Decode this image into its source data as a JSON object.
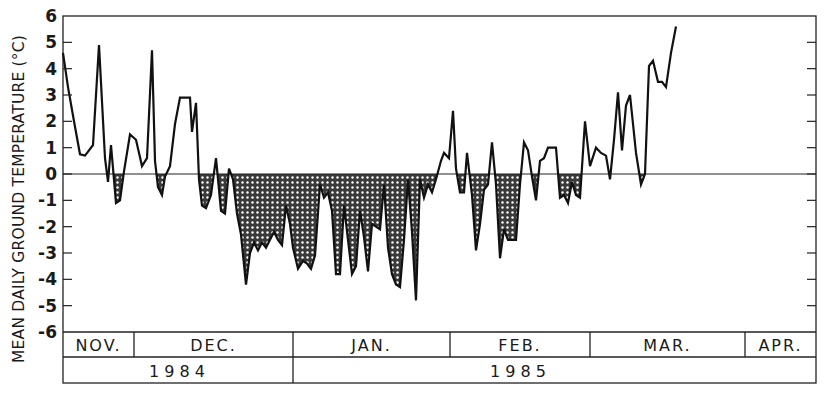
{
  "chart_data": {
    "type": "line",
    "title": "",
    "ylabel": "MEAN DAILY GROUND TEMPERATURE  (°C)",
    "xlabel": "",
    "ylim": [
      -6,
      6
    ],
    "yticks": [
      6,
      5,
      4,
      3,
      2,
      1,
      0,
      -1,
      -2,
      -3,
      -4,
      -5,
      -6
    ],
    "grid": false,
    "legend": null,
    "shading": "cross-hatched area between curve and 0 °C where temperature is below zero",
    "months": [
      {
        "label": "NOV.",
        "x0": 63,
        "x1": 134
      },
      {
        "label": "DEC.",
        "x0": 134,
        "x1": 293
      },
      {
        "label": "JAN.",
        "x0": 293,
        "x1": 450
      },
      {
        "label": "FEB.",
        "x0": 450,
        "x1": 590
      },
      {
        "label": "MAR.",
        "x0": 590,
        "x1": 745
      },
      {
        "label": "APR.",
        "x0": 745,
        "x1": 816
      }
    ],
    "years": [
      {
        "label": "1 9 8 4",
        "x0": 63,
        "x1": 293
      },
      {
        "label": "1 9 8 5",
        "x0": 293,
        "x1": 816
      }
    ],
    "series": [
      {
        "name": "Mean daily ground temperature",
        "points_px_x": [
          63,
          68,
          74,
          80,
          85,
          89,
          93,
          99,
          105,
          108,
          111,
          116,
          120,
          124,
          130,
          136,
          142,
          147,
          152,
          155,
          158,
          162,
          165,
          170,
          175,
          180,
          185,
          190,
          192,
          196,
          199,
          202,
          206,
          211,
          216,
          221,
          225,
          229,
          233,
          237,
          241,
          246,
          250,
          254,
          258,
          262,
          266,
          270,
          274,
          278,
          282,
          286,
          290,
          293,
          298,
          303,
          307,
          311,
          315,
          320,
          324,
          328,
          332,
          336,
          340,
          344,
          348,
          352,
          356,
          360,
          364,
          368,
          372,
          376,
          380,
          384,
          388,
          392,
          396,
          400,
          404,
          408,
          412,
          416,
          420,
          424,
          428,
          432,
          436,
          441,
          444,
          449,
          453,
          456,
          460,
          464,
          467,
          472,
          476,
          480,
          484,
          488,
          492,
          496,
          500,
          504,
          508,
          512,
          516,
          520,
          524,
          528,
          532,
          536,
          540,
          544,
          548,
          552,
          556,
          560,
          564,
          568,
          572,
          576,
          580,
          585,
          590,
          596,
          601,
          606,
          610,
          614,
          618,
          622,
          626,
          630,
          636,
          641,
          645,
          649,
          653,
          658,
          662,
          666,
          671,
          676,
          680,
          684,
          688,
          692,
          696,
          700,
          704,
          708,
          712,
          716,
          720,
          724,
          728,
          732,
          736,
          741,
          745,
          750,
          755,
          760,
          764,
          768,
          772,
          776,
          780,
          785
        ],
        "values": [
          4.6,
          3.3,
          2.0,
          0.75,
          0.7,
          0.9,
          1.1,
          4.9,
          0.6,
          -0.3,
          1.1,
          -1.1,
          -1.0,
          0.1,
          1.5,
          1.3,
          0.3,
          0.6,
          4.7,
          0.5,
          -0.5,
          -0.8,
          -0.1,
          0.3,
          1.9,
          2.9,
          2.9,
          2.9,
          1.6,
          2.7,
          -0.2,
          -1.2,
          -1.3,
          -0.8,
          0.6,
          -1.4,
          -1.5,
          0.2,
          -0.2,
          -1.5,
          -2.3,
          -4.2,
          -3.0,
          -2.6,
          -2.9,
          -2.6,
          -2.8,
          -2.5,
          -2.2,
          -2.5,
          -2.7,
          -1.2,
          -1.9,
          -2.8,
          -3.6,
          -3.3,
          -3.4,
          -3.6,
          -3.1,
          -0.4,
          -0.9,
          -0.7,
          -1.4,
          -3.8,
          -3.8,
          -1.2,
          -2.5,
          -3.8,
          -3.5,
          -1.4,
          -2.4,
          -3.7,
          -1.9,
          -2.0,
          -2.1,
          -0.4,
          -2.8,
          -3.8,
          -4.2,
          -4.3,
          -2.5,
          -0.2,
          -2.2,
          -4.8,
          -0.2,
          -0.9,
          -0.4,
          -0.7,
          -0.2,
          0.5,
          0.8,
          0.6,
          2.4,
          0.2,
          -0.7,
          -0.7,
          0.8,
          -0.8,
          -2.9,
          -1.9,
          -0.6,
          -0.4,
          1.2,
          -0.4,
          -3.2,
          -2.1,
          -2.5,
          -2.5,
          -2.5,
          -0.4,
          1.2,
          0.9,
          -0.1,
          -1.0,
          0.5,
          0.6,
          1.0,
          1.0,
          1.0,
          -0.9,
          -0.8,
          -1.1,
          -0.3,
          -0.8,
          -0.9,
          2.0,
          0.3,
          1.0,
          0.8,
          0.7,
          -0.2,
          1.3,
          3.1,
          0.9,
          2.6,
          3.0,
          0.8,
          -0.4,
          0.0,
          4.1,
          4.3,
          3.5,
          3.5,
          3.3,
          4.6,
          5.6
        ],
        "color": "#111111"
      }
    ]
  },
  "axis": {
    "y_tick_labels": [
      "6",
      "5",
      "4",
      "3",
      "2",
      "1",
      "0",
      "-1",
      "-2",
      "-3",
      "-4",
      "-5",
      "-6"
    ]
  }
}
